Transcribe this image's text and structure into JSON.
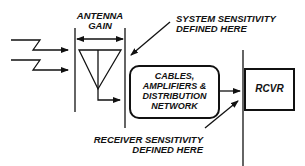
{
  "diagram": {
    "antenna_gain_label": [
      "ANTENNA",
      "GAIN"
    ],
    "system_sensitivity_label": [
      "SYSTEM SENSITIVITY",
      "DEFINED HERE"
    ],
    "network_box_label": [
      "CABLES,",
      "AMPLIFIERS &",
      "DISTRIBUTION",
      "NETWORK"
    ],
    "receiver_box_label": "RCVR",
    "receiver_sensitivity_label": [
      "RECEIVER SENSITIVITY",
      "DEFINED HERE"
    ],
    "colors": {
      "line": "#111111",
      "background": "#ffffff"
    }
  }
}
